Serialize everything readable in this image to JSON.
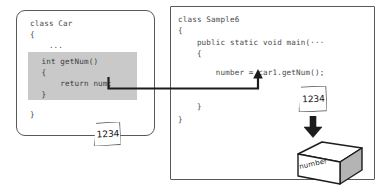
{
  "diagram": {
    "left_panel": {
      "name": "class-car-panel",
      "lines": [
        "class Car",
        "{",
        "    ..."
      ],
      "line1": "class Car",
      "line2": "{",
      "line3": "    ...",
      "closing_brace": "}",
      "method_block": {
        "line1": "  int getNum()",
        "line2": "  {",
        "line3": "      return num;",
        "line4": "  }",
        "shade_color": "#c9c9c9"
      }
    },
    "right_panel": {
      "name": "class-sample6-panel",
      "line1": "class Sample6",
      "line2": "{",
      "line3": "    public static void main(···",
      "line4": "    {",
      "line5": "        number = car1.getNum();",
      "line6": "    }",
      "line7": "}"
    },
    "note_left": {
      "value": "1234",
      "name": "value-note-left"
    },
    "note_right": {
      "value": "1234",
      "name": "value-note-right"
    },
    "box": {
      "label": "number",
      "name": "number-variable-box"
    },
    "connector": {
      "name": "return-value-connector",
      "from": "return num;",
      "to": "number",
      "color": "#1c1c1c"
    },
    "down_arrow": {
      "name": "assign-down-arrow",
      "color": "#1c1c1c"
    },
    "colors": {
      "panel_border": "#595959",
      "code_text": "#4a4a4a",
      "shade": "#c9c9c9",
      "ink": "#1c1c1c",
      "background": "#ffffff"
    }
  }
}
